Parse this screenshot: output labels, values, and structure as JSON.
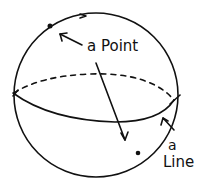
{
  "diagram": {
    "labels": {
      "point": "a Point",
      "line_article": "a",
      "line_word": "Line"
    },
    "colors": {
      "ink": "#111111",
      "background": "#ffffff"
    }
  }
}
